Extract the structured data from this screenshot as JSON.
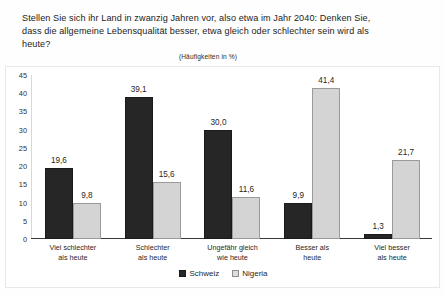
{
  "document": {
    "title_lines": [
      "Stellen Sie sich ihr Land in zwanzig Jahren vor, also etwa im Jahr 2040: Denken Sie,",
      "dass die allgemeine Lebensqualität besser, etwa gleich oder schlechter sein wird als",
      "heute?"
    ],
    "subtitle": "(Häufigkeiten in %)"
  },
  "chart_data": {
    "type": "bar",
    "title": "Stellen Sie sich ihr Land in zwanzig Jahren vor, also etwa im Jahr 2040: Denken Sie, dass die allgemeine Lebensqualität besser, etwa gleich oder schlechter sein wird als heute?",
    "subtitle": "(Häufigkeiten in %)",
    "xlabel": "",
    "ylabel": "",
    "ylim": [
      0,
      45
    ],
    "yticks": [
      0,
      5,
      10,
      15,
      20,
      25,
      30,
      35,
      40,
      45
    ],
    "ytick_labels": [
      "0",
      "5",
      "10",
      "15",
      "20",
      "25",
      "30",
      "35",
      "40",
      "45"
    ],
    "grid": false,
    "legend_position": "bottom",
    "value_label_format": "comma-decimal",
    "categories": [
      "Viel schlechter\nals heute",
      "Schlechter\nals heute",
      "Ungefähr gleich\nwie heute",
      "Besser als\nheute",
      "Viel besser\nals heute"
    ],
    "category_lines": [
      [
        "Viel schlechter",
        "als heute"
      ],
      [
        "Schlechter",
        "als heute"
      ],
      [
        "Ungefähr gleich",
        "wie heute"
      ],
      [
        "Besser als",
        "heute"
      ],
      [
        "Viel besser",
        "als heute"
      ]
    ],
    "series": [
      {
        "name": "Schweiz",
        "color": "#262626",
        "values": [
          19.6,
          39.1,
          30.0,
          9.9,
          1.3
        ],
        "labels": [
          "19,6",
          "39,1",
          "30,0",
          "9,9",
          "1,3"
        ]
      },
      {
        "name": "Nigeria",
        "color": "#d4d4d4",
        "values": [
          9.8,
          15.6,
          11.6,
          41.4,
          21.7
        ],
        "labels": [
          "9,8",
          "15,6",
          "11,6",
          "41,4",
          "21,7"
        ]
      }
    ]
  }
}
